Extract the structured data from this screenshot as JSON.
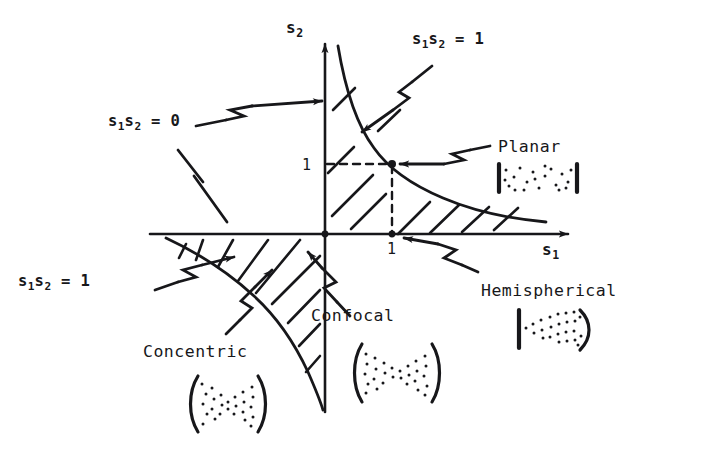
{
  "figure": {
    "type": "diagram",
    "background_color": "#ffffff",
    "ink_color": "#17171a",
    "width": 707,
    "height": 452
  },
  "axes": {
    "x_axis_label": "s",
    "x_axis_sub": "1",
    "y_axis_label": "s",
    "y_axis_sub": "2",
    "origin": {
      "x": 325,
      "y": 234
    },
    "x_tick_label": "1",
    "y_tick_label": "1",
    "x_tick_value": 1,
    "y_tick_value": 1,
    "x_tick_point": {
      "x": 392,
      "y": 234
    },
    "y_tick_point": {
      "x": 325,
      "y": 164
    },
    "stable_point": {
      "x": 392,
      "y": 164
    }
  },
  "curve_labels": {
    "zero_label": "s",
    "zero_sub1": "1",
    "zero_mid": "s",
    "zero_sub2": "2",
    "zero_eq": " = 0",
    "one_upper": " = 1",
    "one_lower": " = 1"
  },
  "annotations": [
    {
      "id": "s1s2-eq-0",
      "text_parts": [
        "s",
        "1",
        "s",
        "2",
        " = 0"
      ],
      "full_text": "s1s2 = 0",
      "label_position": {
        "x": 108,
        "y": 112
      },
      "points_to": "s2-axis",
      "leader": "zigzag-arrow-up-right"
    },
    {
      "id": "s1s2-eq-1-upper",
      "text_parts": [
        "s",
        "1",
        "s",
        "2",
        " = 1"
      ],
      "full_text": "s1s2 = 1",
      "label_position": {
        "x": 412,
        "y": 30
      },
      "points_to": "upper-right-hyperbola",
      "leader": "zigzag-arrow-down-left"
    },
    {
      "id": "s1s2-eq-1-lower",
      "text_parts": [
        "s",
        "1",
        "s",
        "2",
        " = 1"
      ],
      "full_text": "s1s2 = 1",
      "label_position": {
        "x": 18,
        "y": 272
      },
      "points_to": "lower-left-hyperbola",
      "leader": "zigzag-arrow-up-right"
    }
  ],
  "cavity_callouts": [
    {
      "id": "planar",
      "label": "Planar",
      "label_position": {
        "x": 498,
        "y": 145
      },
      "symbol": "flat-flat-mirrors",
      "symbol_position": {
        "x": 497,
        "y": 163
      },
      "points_to": "stable-point-1-1"
    },
    {
      "id": "concentric",
      "label": "Concentric",
      "label_position": {
        "x": 145,
        "y": 343
      },
      "symbol": "concave-concave-spherical",
      "symbol_position": {
        "x": 185,
        "y": 370
      },
      "points_to": "lower-left-hyperbola"
    },
    {
      "id": "confocal",
      "label": "Confocal",
      "label_position": {
        "x": 310,
        "y": 306
      },
      "symbol": "confocal-mirrors",
      "symbol_position": {
        "x": 350,
        "y": 340
      },
      "points_to": "origin"
    },
    {
      "id": "hemispherical",
      "label": "Hemispherical",
      "label_position": {
        "x": 483,
        "y": 282
      },
      "symbol": "flat-concave-mirrors",
      "symbol_position": {
        "x": 505,
        "y": 310
      },
      "points_to": "x-tick-1"
    }
  ],
  "regions": {
    "hatched_note": "Hatch marks border the stable regions: the band between the s2 axis and the first-quadrant branch of s1s2 = 1, and the band in the third quadrant inside the branch of s1s2 = 1.",
    "hatch_count_upper": 9,
    "hatch_count_lower": 9
  }
}
